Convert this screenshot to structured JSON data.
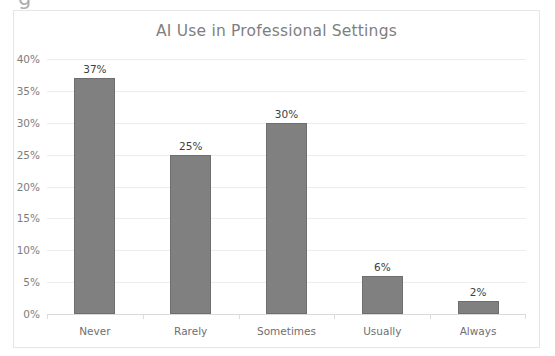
{
  "clipped_text_above": "g",
  "chart": {
    "title": "AI Use in Professional Settings",
    "bar_color": "#808080",
    "bar_border_color": "#6e6e6e",
    "title_color": "#7f7f7f",
    "gridline_color": "#ededed",
    "frame_color": "#e6e6e6"
  },
  "chart_data": {
    "type": "bar",
    "title": "AI Use in Professional Settings",
    "xlabel": "",
    "ylabel": "",
    "categories": [
      "Never",
      "Rarely",
      "Sometimes",
      "Usually",
      "Always"
    ],
    "values": [
      37,
      25,
      30,
      6,
      2
    ],
    "value_labels": [
      "37%",
      "25%",
      "30%",
      "6%",
      "2%"
    ],
    "ylim": [
      0,
      40
    ],
    "ytick_values": [
      40,
      35,
      30,
      25,
      20,
      15,
      10,
      5,
      0
    ],
    "ytick_labels": [
      "40%",
      "35%",
      "30%",
      "25%",
      "20%",
      "15%",
      "10%",
      "5%",
      "0%"
    ],
    "grid": true,
    "legend": false,
    "legend_position": "none"
  }
}
